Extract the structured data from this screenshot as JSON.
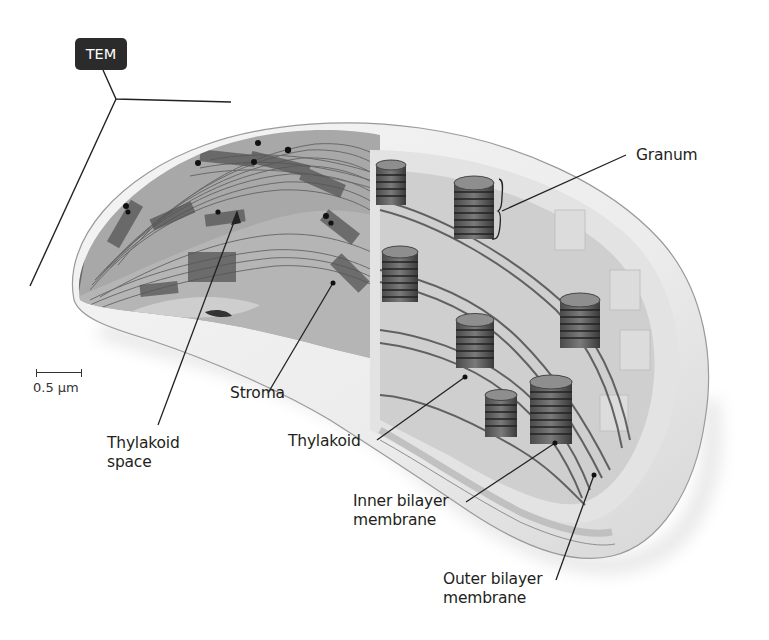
{
  "figure": {
    "badge": "TEM",
    "scale_bar": "0.5 µm",
    "colors": {
      "tem_gray": "#9a9a9a",
      "membrane_fill": "#e6e6e6",
      "granum_dark": "#3c3c3c",
      "badge_bg": "#2b2b2b",
      "label_text": "#231f20"
    },
    "labels": {
      "granum": "Granum",
      "stroma": "Stroma",
      "thylakoid_space_line1": "Thylakoid",
      "thylakoid_space_line2": "space",
      "thylakoid": "Thylakoid",
      "inner_membrane_line1": "Inner bilayer",
      "inner_membrane_line2": "membrane",
      "outer_membrane_line1": "Outer bilayer",
      "outer_membrane_line2": "membrane"
    }
  }
}
